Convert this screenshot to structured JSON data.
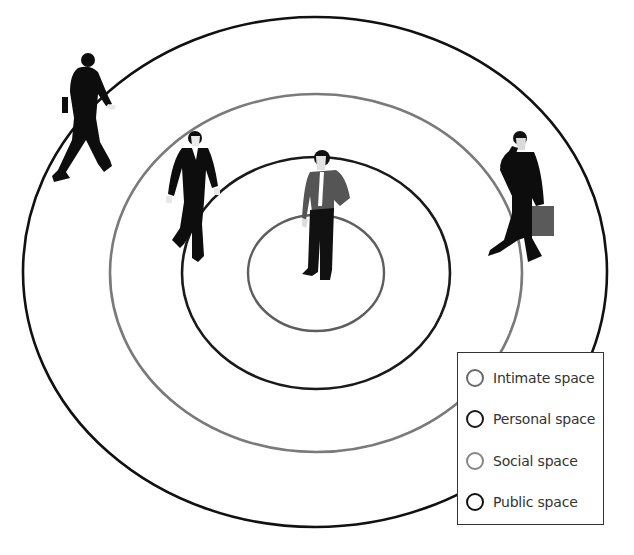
{
  "zones": [
    {
      "key": "intimate",
      "label": "Intimate space",
      "color": "#5e5e5e"
    },
    {
      "key": "personal",
      "label": "Personal space",
      "color": "#1a1a1a"
    },
    {
      "key": "social",
      "label": "Social space",
      "color": "#7a7a7a"
    },
    {
      "key": "public",
      "label": "Public space",
      "color": "#111111"
    }
  ],
  "figures": [
    {
      "name": "man-standing-center",
      "description": "Man in shirt and tie standing at center"
    },
    {
      "name": "man-walking-personal",
      "description": "Man in suit walking at edge of personal space"
    },
    {
      "name": "man-walking-public",
      "description": "Man in suit walking on public space boundary"
    },
    {
      "name": "man-on-phone",
      "description": "Man on phone carrying briefcase in social space"
    }
  ],
  "legend": {
    "items": [
      {
        "label": "Intimate space",
        "color": "#6a6a6a"
      },
      {
        "label": "Personal space",
        "color": "#1a1a1a"
      },
      {
        "label": "Social space",
        "color": "#858585"
      },
      {
        "label": "Public space",
        "color": "#111111"
      }
    ]
  }
}
